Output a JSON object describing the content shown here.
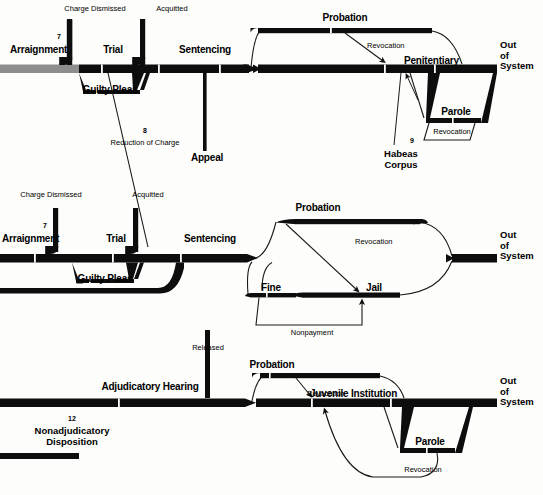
{
  "diagram": {
    "colors": {
      "bar": "#0d0d0d",
      "entry_gray": "#8d8d8d",
      "line": "#1a1a1a",
      "background": "#fdfdfb"
    }
  },
  "rows": {
    "adult_felony": {
      "name": "Adult Felony Track",
      "stages": {
        "arraignment": "Arraignment",
        "trial": "Trial",
        "sentencing": "Sentencing",
        "probation": "Probation",
        "penitentiary": "Penitentiary",
        "parole": "Parole",
        "guilty_pleas": "Guilty Pleas",
        "out_of_system": "Out\nof\nSystem"
      },
      "exits": {
        "charge_dismissed": "Charge Dismissed",
        "acquitted": "Acquitted",
        "appeal": "Appeal"
      },
      "loops": {
        "revocation_probation": "Revocation",
        "revocation_parole": "Revocation"
      },
      "annotations": {
        "arraignment_marker": "7",
        "reduction_marker": "8",
        "reduction_of_charge": "Reduction of Charge",
        "habeas_marker": "9",
        "habeas_corpus": "Habeas\nCorpus"
      }
    },
    "adult_misdemeanor": {
      "name": "Adult Misdemeanor Track",
      "stages": {
        "arraignment": "Arraignment",
        "trial": "Trial",
        "sentencing": "Sentencing",
        "probation": "Probation",
        "fine": "Fine",
        "jail": "Jail",
        "guilty_pleas": "Guilty Pleas",
        "out_of_system": "Out\nof\nSystem"
      },
      "exits": {
        "charge_dismissed": "Charge Dismissed",
        "acquitted": "Acquitted"
      },
      "loops": {
        "revocation": "Revocation",
        "nonpayment": "Nonpayment"
      },
      "annotations": {
        "arraignment_marker": "7"
      }
    },
    "juvenile": {
      "name": "Juvenile Track",
      "stages": {
        "adjudicatory_hearing": "Adjudicatory Hearing",
        "probation": "Probation",
        "juvenile_institution": "Juvenile Institution",
        "parole": "Parole",
        "out_of_system": "Out\nof\nSystem"
      },
      "exits": {
        "released": "Released"
      },
      "loops": {
        "revocation_probation": "Revocation",
        "revocation_parole": "Revocation"
      },
      "annotations": {
        "nonadjudicatory_marker": "12",
        "nonadjudicatory_disposition": "Nonadjudicatory\nDisposition"
      }
    }
  }
}
